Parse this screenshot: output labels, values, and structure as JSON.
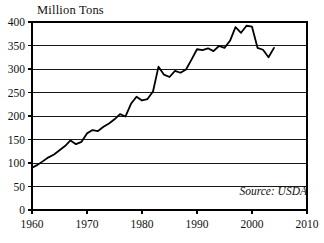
{
  "chart_data": {
    "type": "line",
    "title": "",
    "subtitle": "",
    "ylabel": "Million Tons",
    "xlabel": "",
    "xlim": [
      1960,
      2010
    ],
    "ylim": [
      0,
      400
    ],
    "xticks": [
      1960,
      1970,
      1980,
      1990,
      2000,
      2010
    ],
    "yticks": [
      0,
      50,
      100,
      150,
      200,
      250,
      300,
      350,
      400
    ],
    "grid": "horizontal",
    "legend": "none",
    "annotations": [
      {
        "text": "Source: USDA",
        "position": "bottom-right",
        "style": "italic"
      }
    ],
    "line_color": "#000000",
    "series": [
      {
        "name": "Production",
        "x": [
          1960,
          1961,
          1962,
          1963,
          1964,
          1965,
          1966,
          1967,
          1968,
          1969,
          1970,
          1971,
          1972,
          1973,
          1974,
          1975,
          1976,
          1977,
          1978,
          1979,
          1980,
          1981,
          1982,
          1983,
          1984,
          1985,
          1986,
          1987,
          1988,
          1989,
          1990,
          1991,
          1992,
          1993,
          1994,
          1995,
          1996,
          1997,
          1998,
          1999,
          2000,
          2001,
          2002,
          2003,
          2004
        ],
        "values": [
          90,
          96,
          104,
          112,
          118,
          127,
          136,
          148,
          140,
          145,
          163,
          170,
          168,
          177,
          184,
          193,
          204,
          199,
          226,
          241,
          233,
          236,
          252,
          305,
          288,
          283,
          296,
          292,
          299,
          320,
          342,
          340,
          344,
          338,
          349,
          345,
          360,
          389,
          377,
          392,
          390,
          345,
          341,
          325,
          345
        ]
      }
    ]
  },
  "axis": {
    "y_tick_labels": [
      "400",
      "350",
      "300",
      "250",
      "200",
      "150",
      "100",
      "50",
      "0"
    ],
    "x_tick_labels": [
      "1960",
      "1970",
      "1980",
      "1990",
      "2000",
      "2010"
    ]
  },
  "source": {
    "text": "Source: USDA"
  },
  "colors": {
    "line": "#000000",
    "frame": "#000000",
    "grid": "#000000",
    "background": "#ffffff"
  }
}
